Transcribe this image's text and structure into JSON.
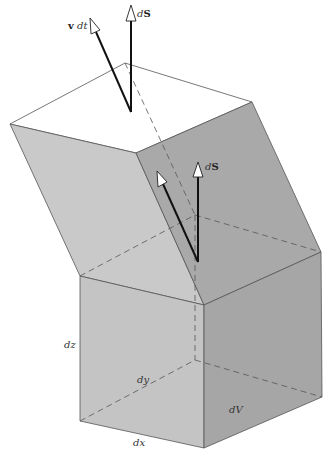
{
  "figure": {
    "labels": {
      "v_dt_bold": "v",
      "v_dt_italic": " dt",
      "dS_top_italic": "d",
      "dS_top_bold": "S",
      "dS_mid_italic": "d",
      "dS_mid_bold": "S",
      "dz": "dz",
      "dy": "dy",
      "dx": "dx",
      "dV": "dV"
    },
    "colors": {
      "background": "#ffffff",
      "top_face": "#ffffff",
      "left_face": "#c9c9c9",
      "right_face": "#a9a9a9",
      "cube_front": "#c4c4c4",
      "cube_right": "#a6a6a6",
      "edge": "#555555",
      "arrow": "#111111"
    }
  }
}
